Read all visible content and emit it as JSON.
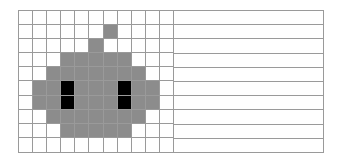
{
  "board": {
    "columns": 11,
    "rows": 10,
    "colors": {
      "empty": "#ffffff",
      "gray": "#8c8c8c",
      "black": "#000000",
      "grid_line": "#9a9a9a"
    },
    "cells": [
      "...........",
      "......g....",
      ".....g.....",
      "...ggggg...",
      "..ggggggg..",
      ".ggbgggbgg.",
      ".ggbgggbgg.",
      "..ggggggg..",
      "...ggggg...",
      "..........."
    ]
  },
  "side_panel": {
    "lines": 10
  }
}
